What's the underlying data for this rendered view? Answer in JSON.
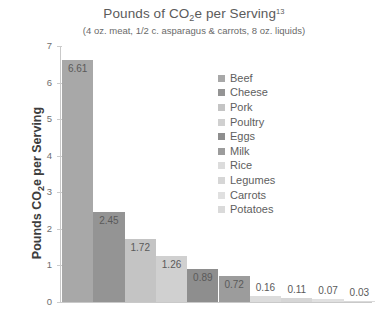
{
  "chart_data": {
    "type": "bar",
    "title": "Pounds of CO2e per Serving",
    "title_parts": {
      "before": "Pounds of CO",
      "subscript": "2",
      "after": "e per Serving",
      "superscript": "13"
    },
    "subtitle": "(4 oz. meat, 1/2 c. asparagus & carrots, 8 oz. liquids)",
    "xlabel": "",
    "ylabel": "Pounds CO2e per Serving",
    "ylabel_parts": {
      "before": "Pounds CO",
      "subscript": "2",
      "after": "e per Serving"
    },
    "categories": [
      "Beef",
      "Cheese",
      "Pork",
      "Poultry",
      "Eggs",
      "Milk",
      "Rice",
      "Legumes",
      "Carrots",
      "Potatoes"
    ],
    "values": [
      6.61,
      2.45,
      1.72,
      1.26,
      0.89,
      0.72,
      0.16,
      0.11,
      0.07,
      0.03
    ],
    "value_labels": [
      "6.61",
      "2.45",
      "1.72",
      "1.26",
      "0.89",
      "0.72",
      "0.16",
      "0.11",
      "0.07",
      "0.03"
    ],
    "colors": [
      "#a8a8a8",
      "#949494",
      "#c4c4c4",
      "#d0d0d0",
      "#8e8e8e",
      "#9c9c9c",
      "#dcdcdc",
      "#d6d6d6",
      "#e0e0e0",
      "#dadada"
    ],
    "ylim": [
      0,
      7
    ],
    "yticks": [
      0,
      1,
      2,
      3,
      4,
      5,
      6,
      7
    ],
    "ytick_labels": [
      "0",
      "1",
      "2",
      "3",
      "4",
      "5",
      "6",
      "7"
    ],
    "grid": false,
    "legend_position": "inside-upper-right"
  }
}
